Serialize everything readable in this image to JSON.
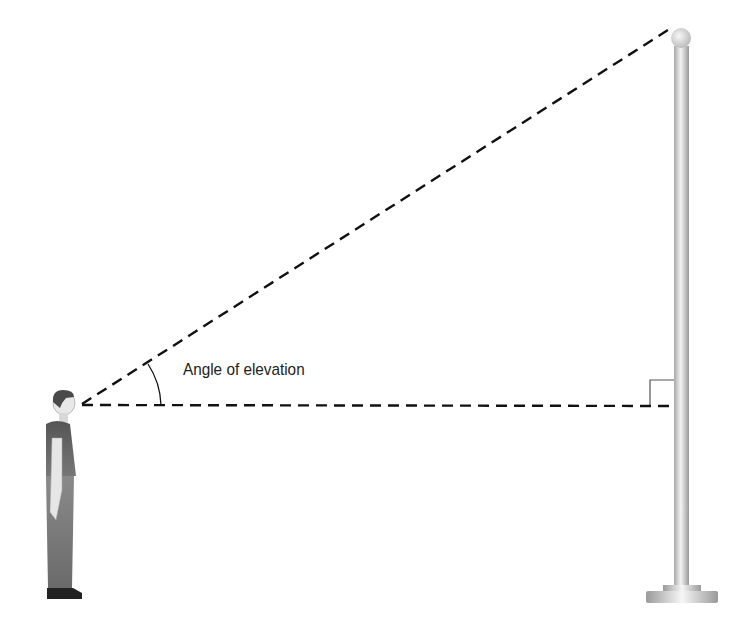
{
  "diagram": {
    "angle_label": "Angle of elevation",
    "elements": {
      "observer": "person-standing",
      "target": "flagpole",
      "line_of_sight": "dashed-sloped-line",
      "horizontal": "dashed-horizontal-line",
      "right_angle_marker": "square-at-pole"
    },
    "colors": {
      "line": "#111111",
      "pole_light": "#f2f2f2",
      "pole_dark": "#b5b5b5",
      "figure_dark": "#4a4a4a"
    }
  }
}
